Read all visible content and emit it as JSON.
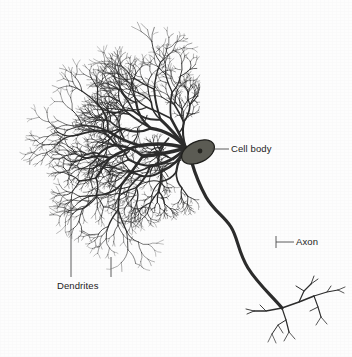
{
  "figure": {
    "type": "labeled-biological-diagram",
    "width": 352,
    "height": 357,
    "background_color": "#fdfdfd",
    "ink_color": "#2b2b2b",
    "label_color": "#1c1c1c"
  },
  "labels": {
    "cell_body": "Cell body",
    "axon": "Axon",
    "dendrites": "Dendrites"
  },
  "leader_lines": [
    {
      "name": "cell-body-leader",
      "x1": 212,
      "y1": 149,
      "x2": 229,
      "y2": 149
    },
    {
      "name": "axon-leader",
      "x1": 276,
      "y1": 242,
      "x2": 294,
      "y2": 242
    },
    {
      "name": "axon-leader-tick",
      "x1": 276,
      "y1": 236,
      "x2": 276,
      "y2": 248
    },
    {
      "name": "dendrites-leader-left",
      "x1": 71,
      "y1": 199,
      "x2": 71,
      "y2": 277
    },
    {
      "name": "dendrites-leader-right",
      "x1": 111,
      "y1": 257,
      "x2": 111,
      "y2": 277
    }
  ],
  "soma": {
    "name": "cell-body",
    "cx": 198,
    "cy": 152,
    "rx": 17.5,
    "ry": 10.5,
    "rotation": -26,
    "fill": "#5b5b53",
    "stroke": "#1f1f1c",
    "nucleus": {
      "cx": 200,
      "cy": 151,
      "r": 2.4,
      "fill": "#24241f"
    }
  },
  "axon": {
    "name": "axon-fiber",
    "path": "M 192,163 C 196,177 200,186 206,197 C 214,211 224,216 231,227 C 238,238 238,252 248,268 C 258,284 272,296 282,308",
    "width_start": 3.2,
    "width_end": 1.5
  },
  "axon_terminal": {
    "origin_x": 282,
    "origin_y": 308,
    "branches": [
      {
        "path": "M 282,308 L 299,302 L 314,296",
        "w": 1.5
      },
      {
        "path": "M 299,302 L 304,291 L 311,284",
        "w": 1.2
      },
      {
        "path": "M 304,291 L 296,286",
        "w": 1.0
      },
      {
        "path": "M 311,284 L 318,279",
        "w": 0.9
      },
      {
        "path": "M 311,284 L 314,276",
        "w": 0.9
      },
      {
        "path": "M 314,296 L 327,292 L 338,290",
        "w": 1.2
      },
      {
        "path": "M 327,292 L 331,286",
        "w": 0.9
      },
      {
        "path": "M 338,290 L 345,287",
        "w": 0.8
      },
      {
        "path": "M 338,290 L 344,293",
        "w": 0.8
      },
      {
        "path": "M 314,296 L 318,307 L 321,317",
        "w": 1.1
      },
      {
        "path": "M 318,307 L 310,311",
        "w": 0.9
      },
      {
        "path": "M 321,317 L 316,325",
        "w": 0.8
      },
      {
        "path": "M 321,317 L 327,324",
        "w": 0.8
      },
      {
        "path": "M 282,308 L 266,311 L 254,311",
        "w": 1.3
      },
      {
        "path": "M 266,311 L 260,305",
        "w": 0.9
      },
      {
        "path": "M 254,311 L 246,309",
        "w": 0.9
      },
      {
        "path": "M 254,311 L 247,314",
        "w": 0.9
      },
      {
        "path": "M 282,308 L 286,320 L 289,332",
        "w": 1.2
      },
      {
        "path": "M 286,320 L 278,325 L 272,334",
        "w": 1.0
      },
      {
        "path": "M 278,325 L 283,333",
        "w": 0.8
      },
      {
        "path": "M 289,332 L 284,341",
        "w": 0.8
      },
      {
        "path": "M 289,332 L 295,339",
        "w": 0.8
      },
      {
        "path": "M 272,334 L 268,342",
        "w": 0.7
      },
      {
        "path": "M 272,334 L 276,343",
        "w": 0.7
      }
    ]
  },
  "dendrite_tree": {
    "name": "dendritic-arbor",
    "description": "Dense fractal dendritic arborization radiating left and upward from the soma",
    "origin_x": 186,
    "origin_y": 148,
    "trunk_width": 3.4,
    "depth": 8,
    "seed": 20346,
    "trunks": [
      {
        "angle": 186,
        "length": 46,
        "width": 3.6
      },
      {
        "angle": 168,
        "length": 44,
        "width": 3.4
      },
      {
        "angle": 208,
        "length": 40,
        "width": 3.3
      },
      {
        "angle": 150,
        "length": 40,
        "width": 3.1
      },
      {
        "angle": 228,
        "length": 38,
        "width": 3.0
      },
      {
        "angle": 133,
        "length": 34,
        "width": 2.7
      },
      {
        "angle": 247,
        "length": 33,
        "width": 2.6
      },
      {
        "angle": 113,
        "length": 26,
        "width": 2.2
      },
      {
        "angle": 266,
        "length": 26,
        "width": 2.1
      }
    ],
    "bounds": {
      "x_min": 14,
      "x_max": 200,
      "y_min": 22,
      "y_max": 272
    }
  }
}
